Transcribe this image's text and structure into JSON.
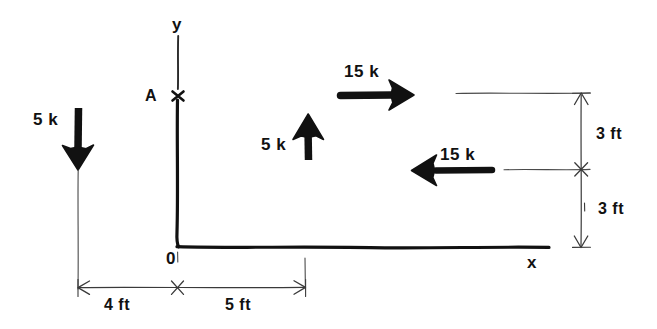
{
  "figure": {
    "type": "engineering-free-body-diagram",
    "ink_color": "#111111",
    "thin_line_color": "#444444",
    "background_color": "#ffffff"
  },
  "axes": {
    "y_label": "y",
    "x_label": "x",
    "origin_label": "0"
  },
  "points": {
    "a_label": "A"
  },
  "forces": [
    {
      "id": "force-5k-down",
      "label": "5 k",
      "magnitude": 5,
      "unit": "k",
      "direction": "down"
    },
    {
      "id": "force-5k-up",
      "label": "5 k",
      "magnitude": 5,
      "unit": "k",
      "direction": "up"
    },
    {
      "id": "force-15k-right",
      "label": "15 k",
      "magnitude": 15,
      "unit": "k",
      "direction": "right"
    },
    {
      "id": "force-15k-left",
      "label": "15 k",
      "magnitude": 15,
      "unit": "k",
      "direction": "left"
    }
  ],
  "dimensions": [
    {
      "id": "dim-4ft",
      "label": "4 ft",
      "value": 4,
      "unit": "ft",
      "orientation": "horizontal"
    },
    {
      "id": "dim-5ft",
      "label": "5 ft",
      "value": 5,
      "unit": "ft",
      "orientation": "horizontal"
    },
    {
      "id": "dim-3ft-upper",
      "label": "3 ft",
      "value": 3,
      "unit": "ft",
      "orientation": "vertical"
    },
    {
      "id": "dim-3ft-lower",
      "label": "3 ft",
      "value": 3,
      "unit": "ft",
      "orientation": "vertical"
    }
  ]
}
